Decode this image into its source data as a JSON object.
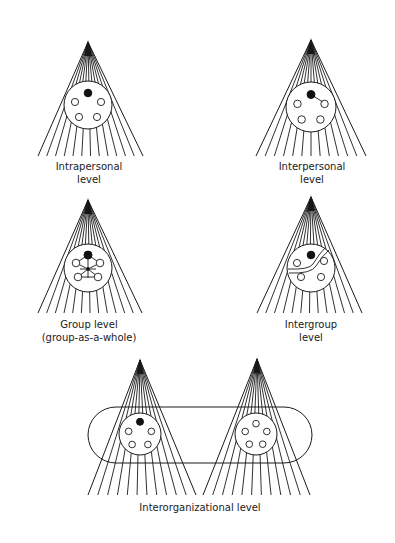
{
  "figure": {
    "panels": [
      {
        "id": "intrapersonal",
        "label_line1": "Intrapersonal",
        "label_line2": "level",
        "apex": [
          88,
          40
        ],
        "base_y": 156,
        "base_left": 38,
        "base_right": 143,
        "circle": {
          "cx": 88,
          "cy": 105,
          "r": 24
        },
        "focal_member": "filled-top",
        "members": 4,
        "relation": "none"
      },
      {
        "id": "interpersonal",
        "label_line1": "Interpersonal",
        "label_line2": "level",
        "apex": [
          311,
          38
        ],
        "base_y": 156,
        "base_left": 256,
        "base_right": 366,
        "circle": {
          "cx": 311,
          "cy": 107,
          "r": 25
        },
        "focal_member": "filled-top",
        "members": 4,
        "relation": "focal-to-one-member"
      },
      {
        "id": "group",
        "label_line1": "Group level",
        "label_line2": "(group-as-a-whole)",
        "apex": [
          88,
          198
        ],
        "base_y": 313,
        "base_left": 38,
        "base_right": 142,
        "circle": {
          "cx": 88,
          "cy": 268,
          "r": 24
        },
        "focal_member": "filled-top",
        "members": 4,
        "relation": "hub-connecting-all"
      },
      {
        "id": "intergroup",
        "label_line1": "Intergroup",
        "label_line2": "level",
        "apex": [
          311,
          195
        ],
        "base_y": 313,
        "base_left": 257,
        "base_right": 362,
        "circle": {
          "cx": 311,
          "cy": 268,
          "r": 24
        },
        "focal_member": "filled-top",
        "members": 4,
        "relation": "subgroup-boundary"
      }
    ],
    "bottom": {
      "id": "interorganizational",
      "label": "Interorganizational level",
      "left": {
        "apex": [
          140,
          358
        ],
        "base_left": 88,
        "base_right": 196,
        "circle": {
          "cx": 140,
          "cy": 434,
          "r": 21
        },
        "focal": true,
        "members": 4
      },
      "right": {
        "apex": [
          257,
          357
        ],
        "base_left": 203,
        "base_right": 310,
        "circle": {
          "cx": 256,
          "cy": 434,
          "r": 21
        },
        "focal": false,
        "members": 5
      },
      "base_y": 495,
      "boundary": {
        "x": 88,
        "y": 407,
        "width": 224,
        "height": 56,
        "rx": 28
      }
    }
  }
}
